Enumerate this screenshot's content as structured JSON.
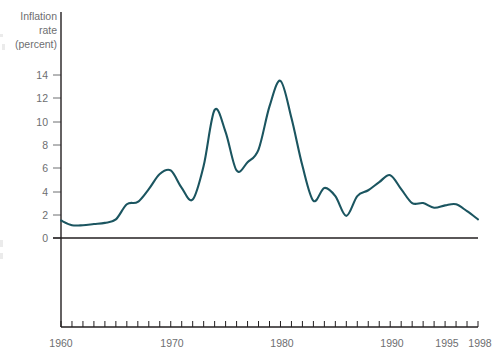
{
  "chart_data": {
    "type": "line",
    "title": "",
    "subtitle": "",
    "xlabel": "",
    "ylabel": "Inflation rate (percent)",
    "ylabel_lines": [
      "Inflation",
      "rate",
      "(percent)"
    ],
    "grid": false,
    "legend": "none",
    "line_color": "#1b5560",
    "axis_color": "#231f20",
    "text_color": "#6d6e70",
    "background_color": "#ffffff",
    "xlim": [
      1960,
      1998
    ],
    "ylim": [
      0,
      14
    ],
    "ytick_values": [
      0,
      2,
      4,
      6,
      8,
      10,
      12,
      14
    ],
    "ytick_labels": [
      "0",
      "2",
      "4",
      "6",
      "8",
      "10",
      "12",
      "14"
    ],
    "xtick_values": [
      1960,
      1970,
      1980,
      1990,
      1995,
      1998
    ],
    "xtick_labels": [
      "1960",
      "1970",
      "1980",
      "1990",
      "1995",
      "1998"
    ],
    "xminor_step": 1,
    "series": [
      {
        "name": "Inflation rate",
        "x": [
          1960,
          1961,
          1962,
          1963,
          1964,
          1965,
          1966,
          1967,
          1968,
          1969,
          1970,
          1971,
          1972,
          1973,
          1974,
          1975,
          1976,
          1977,
          1978,
          1979,
          1980,
          1981,
          1982,
          1983,
          1984,
          1985,
          1986,
          1987,
          1988,
          1989,
          1990,
          1991,
          1992,
          1993,
          1994,
          1995,
          1996,
          1997,
          1998
        ],
        "values": [
          1.5,
          1.1,
          1.1,
          1.2,
          1.3,
          1.6,
          2.9,
          3.1,
          4.2,
          5.5,
          5.8,
          4.3,
          3.3,
          6.2,
          11.0,
          9.1,
          5.8,
          6.5,
          7.6,
          11.3,
          13.5,
          10.3,
          6.2,
          3.2,
          4.3,
          3.6,
          1.9,
          3.6,
          4.1,
          4.8,
          5.4,
          4.2,
          3.0,
          3.0,
          2.6,
          2.8,
          2.9,
          2.3,
          1.6
        ]
      }
    ]
  }
}
